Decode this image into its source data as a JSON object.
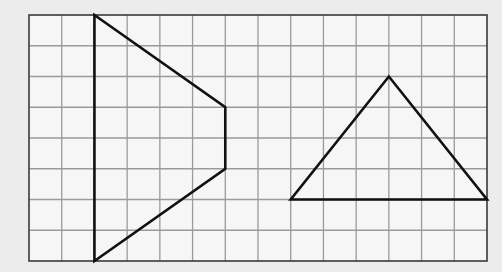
{
  "grid": {
    "columns": 14,
    "rows": 8,
    "background_color": "#f6f6f6",
    "line_color": "#9a9a9a",
    "border_color": "#3a3a3a"
  },
  "shapes": [
    {
      "name": "trapezoid",
      "stroke": "#111111",
      "vertices": [
        [
          2,
          0
        ],
        [
          6,
          3
        ],
        [
          6,
          5
        ],
        [
          2,
          8
        ]
      ]
    },
    {
      "name": "triangle",
      "stroke": "#111111",
      "vertices": [
        [
          11,
          2
        ],
        [
          14,
          6
        ],
        [
          8,
          6
        ]
      ]
    }
  ]
}
